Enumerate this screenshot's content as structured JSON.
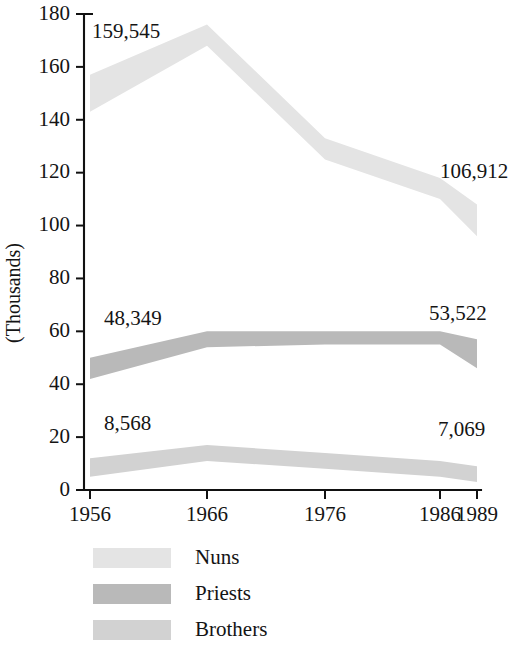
{
  "chart_data": {
    "type": "area",
    "title": "",
    "subtitle": "",
    "xlabel": "",
    "ylabel": "(Thousands)",
    "x": [
      "1956",
      "1966",
      "1976",
      "1986",
      "1989"
    ],
    "xtick_labels": [
      "1956",
      "1966",
      "1976",
      "1986",
      "1989"
    ],
    "ytick_labels": [
      "0",
      "20",
      "40",
      "60",
      "80",
      "100",
      "120",
      "140",
      "160",
      "180"
    ],
    "ytick_values": [
      0,
      20,
      40,
      60,
      80,
      100,
      120,
      140,
      160,
      180
    ],
    "ylim": [
      0,
      180
    ],
    "grid": false,
    "legend_position": "bottom",
    "series": [
      {
        "name": "Nuns",
        "color": "#e4e4e4",
        "values": [
          151,
          176,
          130,
          115,
          102
        ],
        "band_upper": [
          157,
          176,
          133,
          118,
          108
        ],
        "band_lower": [
          143,
          168,
          125,
          110,
          96
        ]
      },
      {
        "name": "Priests",
        "color": "#b9b9b9",
        "values": [
          46,
          58,
          58,
          58,
          51
        ],
        "band_upper": [
          50,
          60,
          60,
          60,
          57
        ],
        "band_lower": [
          42,
          54,
          55,
          55,
          46
        ]
      },
      {
        "name": "Brothers",
        "color": "#d2d2d2",
        "values": [
          9,
          14,
          11,
          8,
          6
        ],
        "band_upper": [
          12,
          17,
          14,
          11,
          9
        ],
        "band_lower": [
          5,
          11,
          8,
          5,
          3
        ]
      }
    ],
    "annotations": [
      {
        "text": "159,545",
        "series": "Nuns",
        "at": "1956",
        "x_px": 92,
        "y_px": 38
      },
      {
        "text": "106,912",
        "series": "Nuns",
        "at": "1989",
        "x_px": 440,
        "y_px": 178
      },
      {
        "text": "48,349",
        "series": "Priests",
        "at": "1956",
        "x_px": 104,
        "y_px": 325
      },
      {
        "text": "53,522",
        "series": "Priests",
        "at": "1989",
        "x_px": 429,
        "y_px": 320
      },
      {
        "text": "8,568",
        "series": "Brothers",
        "at": "1956",
        "x_px": 104,
        "y_px": 430
      },
      {
        "text": "7,069",
        "series": "Brothers",
        "at": "1989",
        "x_px": 438,
        "y_px": 436
      }
    ]
  },
  "legend": {
    "items": [
      {
        "label": "Nuns",
        "color": "#e4e4e4"
      },
      {
        "label": "Priests",
        "color": "#b9b9b9"
      },
      {
        "label": "Brothers",
        "color": "#d2d2d2"
      }
    ]
  },
  "axis": {
    "y_title": "(Thousands)"
  }
}
